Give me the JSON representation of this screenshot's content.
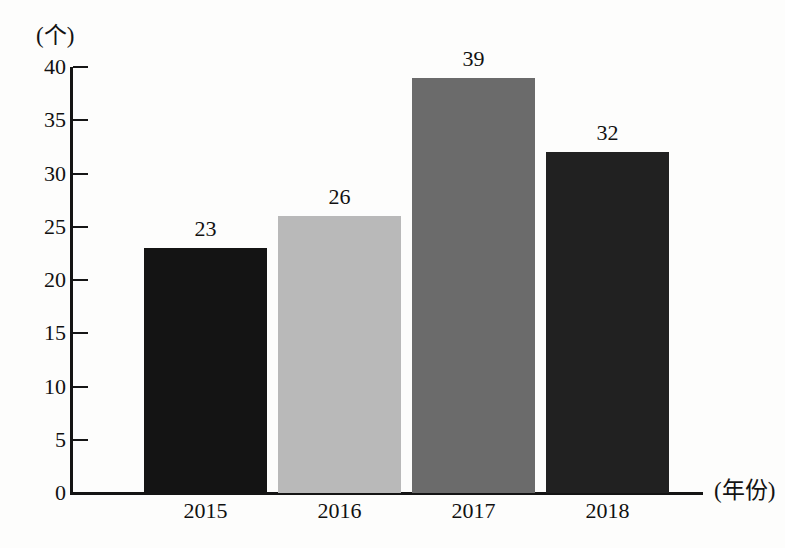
{
  "chart_data": {
    "type": "bar",
    "title": "",
    "subtitle": "",
    "xlabel": "(年份)",
    "ylabel": "(个)",
    "categories": [
      "2015",
      "2016",
      "2017",
      "2018"
    ],
    "values": [
      23,
      26,
      39,
      32
    ],
    "value_labels": [
      "23",
      "26",
      "39",
      "32"
    ],
    "ylim": [
      0,
      40
    ],
    "ytick_labels": [
      "0",
      "5",
      "10",
      "15",
      "20",
      "25",
      "30",
      "35",
      "40"
    ],
    "ytick_values": [
      0,
      5,
      10,
      15,
      20,
      25,
      30,
      35,
      40
    ],
    "ytick_step": 5,
    "grid": false,
    "legend": false,
    "legend_position": "none",
    "bar_colors": [
      "#141414",
      "#b9b9b9",
      "#6b6b6b",
      "#212121"
    ],
    "axis_color": "#141414",
    "background_color": "#fdfdfc",
    "text_color": "#111111"
  }
}
